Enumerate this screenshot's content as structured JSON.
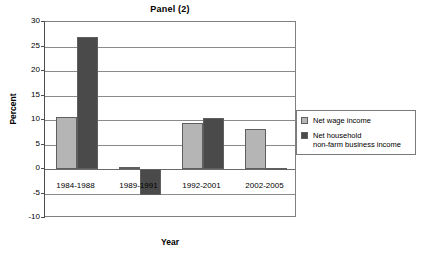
{
  "chart_data": {
    "type": "bar",
    "title": "Panel (2)",
    "xlabel": "Year",
    "ylabel": "Percent",
    "categories": [
      "1984-1988",
      "1989-1991",
      "1992-2001",
      "2002-2005"
    ],
    "series": [
      {
        "name": "Net wage income",
        "color": "#b5b5b5",
        "values": [
          10.7,
          0.5,
          9.3,
          8.2
        ]
      },
      {
        "name": "Net household\nnon-farm business income",
        "color": "#4a4a4a",
        "values": [
          27.0,
          -5.4,
          10.4,
          0.2
        ]
      }
    ],
    "ylim": [
      -10,
      30
    ],
    "yticks": [
      30,
      25,
      20,
      15,
      10,
      5,
      0,
      -5,
      -10
    ],
    "ytick_labels": [
      "30",
      "25",
      "20",
      "15",
      "10",
      "5",
      "0",
      "-5",
      "-10"
    ],
    "grid": true,
    "legend_position": "right"
  },
  "legend": {
    "items": [
      {
        "label": "Net wage income",
        "color": "#b5b5b5"
      },
      {
        "label": "Net household\nnon-farm business income",
        "color": "#4a4a4a"
      }
    ]
  },
  "colors": {
    "series_light": "#b5b5b5",
    "series_dark": "#4a4a4a",
    "gridline": "#8a8a8a",
    "frame": "#808080",
    "axis": "#4d4d4d",
    "background": "#ffffff"
  }
}
